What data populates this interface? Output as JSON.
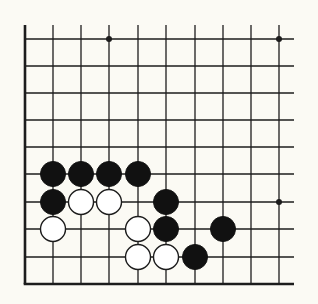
{
  "diagram": {
    "type": "go-board-fragment",
    "background_color": "#fbfaf4",
    "line_color": "#1c1c1c",
    "grid": {
      "columns": 10,
      "rows": 10,
      "x_positions": [
        25,
        53,
        81,
        109,
        138,
        166,
        195,
        223,
        251,
        279
      ],
      "y_positions": [
        39,
        66,
        93,
        120,
        147,
        174,
        202,
        229,
        257,
        284
      ],
      "line_top": 25,
      "line_right": 294,
      "left_edge_thick": true,
      "bottom_edge_thick": true
    },
    "star_points": [
      {
        "col": 3,
        "row": 0
      },
      {
        "col": 9,
        "row": 0
      },
      {
        "col": 9,
        "row": 6
      }
    ],
    "stones": [
      {
        "color": "black",
        "col": 1,
        "row": 5
      },
      {
        "color": "black",
        "col": 2,
        "row": 5
      },
      {
        "color": "black",
        "col": 3,
        "row": 5
      },
      {
        "color": "black",
        "col": 4,
        "row": 5
      },
      {
        "color": "black",
        "col": 1,
        "row": 6
      },
      {
        "color": "white",
        "col": 2,
        "row": 6
      },
      {
        "color": "white",
        "col": 3,
        "row": 6
      },
      {
        "color": "black",
        "col": 5,
        "row": 6
      },
      {
        "color": "white",
        "col": 1,
        "row": 7
      },
      {
        "color": "white",
        "col": 4,
        "row": 7
      },
      {
        "color": "black",
        "col": 5,
        "row": 7
      },
      {
        "color": "black",
        "col": 7,
        "row": 7
      },
      {
        "color": "white",
        "col": 4,
        "row": 8
      },
      {
        "color": "white",
        "col": 5,
        "row": 8
      },
      {
        "color": "black",
        "col": 6,
        "row": 8
      }
    ],
    "stone_radius": 12.5
  }
}
